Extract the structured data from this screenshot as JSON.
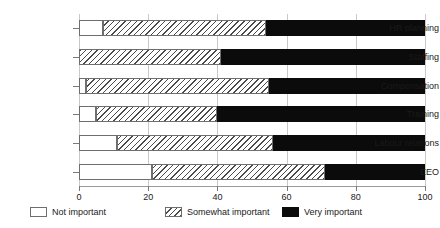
{
  "chart_data": {
    "type": "bar",
    "orientation": "horizontal",
    "stacked": true,
    "stack_mode": "percent",
    "title": "",
    "subtitle": "",
    "xlabel": "",
    "ylabel": "",
    "xlim": [
      0,
      100
    ],
    "xticks": [
      0,
      20,
      40,
      60,
      80,
      100
    ],
    "xtick_labels": [
      "0",
      "20",
      "40",
      "60",
      "80",
      "100"
    ],
    "grid": true,
    "grid_axis": "x",
    "legend_position": "bottom",
    "categories": [
      "HR planning",
      "Staffing",
      "Compensation",
      "Training",
      "Labour relations",
      "EEO"
    ],
    "series": [
      {
        "name": "Not important",
        "fill": "white",
        "color": "#ffffff",
        "values": [
          7,
          0,
          2,
          5,
          11,
          21
        ]
      },
      {
        "name": "Somewhat important",
        "fill": "hatched",
        "color": "#4a4a4a",
        "values": [
          47,
          41,
          53,
          35,
          45,
          50
        ]
      },
      {
        "name": "Very important",
        "fill": "solid",
        "color": "#0b0b0b",
        "values": [
          46,
          59,
          45,
          60,
          44,
          29
        ]
      }
    ],
    "segment_boundaries": [
      {
        "category": "HR planning",
        "not_end": 7,
        "somewhat_end": 54,
        "very_end": 100
      },
      {
        "category": "Staffing",
        "not_end": 0,
        "somewhat_end": 41,
        "very_end": 100
      },
      {
        "category": "Compensation",
        "not_end": 2,
        "somewhat_end": 55,
        "very_end": 100
      },
      {
        "category": "Training",
        "not_end": 5,
        "somewhat_end": 40,
        "very_end": 100
      },
      {
        "category": "Labour relations",
        "not_end": 11,
        "somewhat_end": 56,
        "very_end": 100
      },
      {
        "category": "EEO",
        "not_end": 21,
        "somewhat_end": 71,
        "very_end": 100
      }
    ]
  },
  "legend": {
    "items": [
      {
        "label": "Not important",
        "swatch": "white-swatch-icon"
      },
      {
        "label": "Somewhat important",
        "swatch": "hatched-swatch-icon"
      },
      {
        "label": "Very important",
        "swatch": "black-swatch-icon"
      }
    ]
  },
  "colors": {
    "background": "#ffffff",
    "axis": "#9a9a9a",
    "grid": "#c9c9c9",
    "text": "#1a1a1a",
    "bar_outline": "#6e6e6e",
    "very_important": "#0b0b0b"
  }
}
